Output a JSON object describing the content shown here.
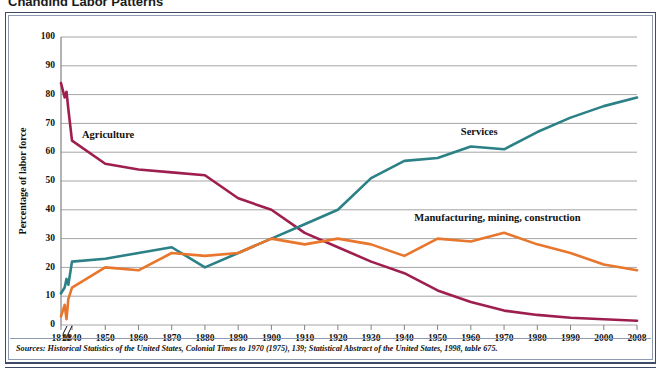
{
  "figure": {
    "title": "Changing Labor Patterns",
    "source_note": "Sources: Historical Statistics of the United States, Colonial Times to 1970 (1975), 139; Statistical Abstract of the United States, 1998, table 675."
  },
  "chart_data": {
    "type": "line",
    "title": "Changing Labor Patterns",
    "xlabel": "",
    "ylabel": "Percentage of labor force",
    "ylim": [
      0,
      100
    ],
    "ytick_labels": [
      "0",
      "10",
      "20",
      "30",
      "40",
      "50",
      "60",
      "70",
      "80",
      "90",
      "100"
    ],
    "ytick_values": [
      0,
      10,
      20,
      30,
      40,
      50,
      60,
      70,
      80,
      90,
      100
    ],
    "grid": true,
    "legend": "inline-labels",
    "axis_break": true,
    "axis_break_note": "break in x-axis between 1810 and 1840",
    "x": [
      1810,
      1820,
      1825,
      1830,
      1840,
      1850,
      1860,
      1870,
      1880,
      1890,
      1900,
      1910,
      1920,
      1930,
      1940,
      1950,
      1960,
      1970,
      1980,
      1990,
      2000,
      2008
    ],
    "xtick_labels": [
      "1810",
      "1840",
      "1850",
      "1860",
      "1870",
      "1880",
      "1890",
      "1900",
      "1910",
      "1920",
      "1930",
      "1940",
      "1950",
      "1960",
      "1970",
      "1980",
      "1990",
      "2000",
      "2008"
    ],
    "xtick_values": [
      1810,
      1840,
      1850,
      1860,
      1870,
      1880,
      1890,
      1900,
      1910,
      1920,
      1930,
      1940,
      1950,
      1960,
      1970,
      1980,
      1990,
      2000,
      2008
    ],
    "series": [
      {
        "name": "Agriculture",
        "color": "#9E1F4F",
        "label_x": 1843,
        "label_y": 65,
        "values": [
          84,
          79,
          81,
          75,
          64,
          56,
          54,
          53,
          52,
          44,
          40,
          32,
          27,
          22,
          18,
          12,
          8,
          5,
          3.5,
          2.5,
          2,
          1.5
        ]
      },
      {
        "name": "Services",
        "color": "#2B8186",
        "label_x": 1957,
        "label_y": 66,
        "values": [
          11,
          13,
          16,
          14,
          22,
          23,
          25,
          27,
          20,
          25,
          30,
          35,
          40,
          51,
          57,
          58,
          62,
          61,
          67,
          72,
          76,
          79
        ]
      },
      {
        "name": "Manufacturing, mining, construction",
        "color": "#E8762C",
        "label_x": 1943,
        "label_y": 36,
        "values": [
          3,
          7,
          2,
          9,
          13,
          20,
          19,
          25,
          24,
          25,
          30,
          28,
          30,
          28,
          24,
          30,
          29,
          32,
          28,
          25,
          21,
          19
        ]
      }
    ]
  }
}
